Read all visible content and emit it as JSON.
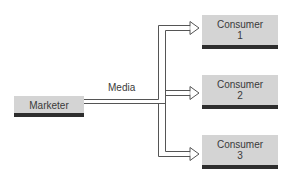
{
  "diagram": {
    "source": {
      "label": "Marketer"
    },
    "channel": {
      "label": "Media"
    },
    "targets": [
      {
        "label": "Consumer",
        "number": "1"
      },
      {
        "label": "Consumer",
        "number": "2"
      },
      {
        "label": "Consumer",
        "number": "3"
      }
    ],
    "colors": {
      "box_fill": "#d4d4d4",
      "box_bar": "#2e2e2e",
      "line": "#555555",
      "text": "#3a3a3a"
    }
  }
}
